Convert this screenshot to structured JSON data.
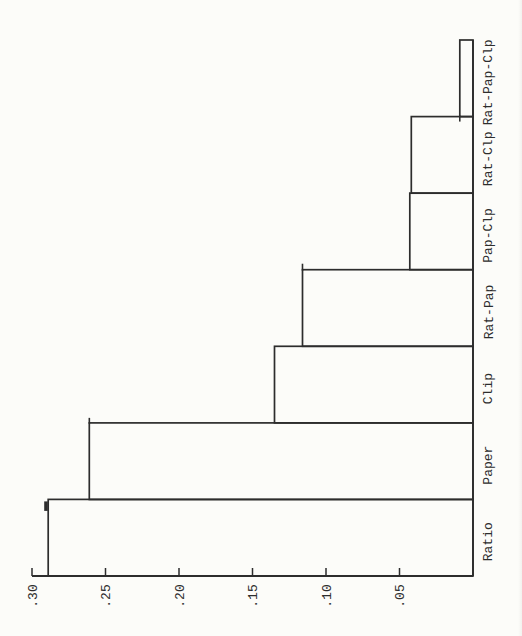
{
  "figure": {
    "kind": "scanned rotated bar chart",
    "paper_color": "#fcfcf9",
    "ink_color": "#2d2d2d"
  },
  "chart_data": {
    "type": "bar",
    "title": "",
    "categories": [
      "Rat-Pap-Clp",
      "Rat-Clp",
      "Pap-Clp",
      "Rat-Pap",
      "Clip",
      "Paper",
      "Ratio"
    ],
    "values": [
      0.009,
      0.042,
      0.043,
      0.116,
      0.135,
      0.261,
      0.289
    ],
    "value_axis": {
      "label": "",
      "tick_labels": [
        ".30",
        ".25",
        ".20",
        ".15",
        ".10",
        ".05"
      ],
      "tick_values": [
        0.3,
        0.25,
        0.2,
        0.15,
        0.1,
        0.05
      ],
      "range": [
        0,
        0.3
      ]
    },
    "layout": {
      "orientation": "page rotated 90deg CCW: bars extend leftward from a right-side zero baseline; category labels along right edge reading bottom-to-top; value axis along bottom increasing right-to-left",
      "grid": "off",
      "legend": "none",
      "bar_fill": "none (outline only)",
      "categories_order": "top-to-bottom as printed"
    }
  }
}
